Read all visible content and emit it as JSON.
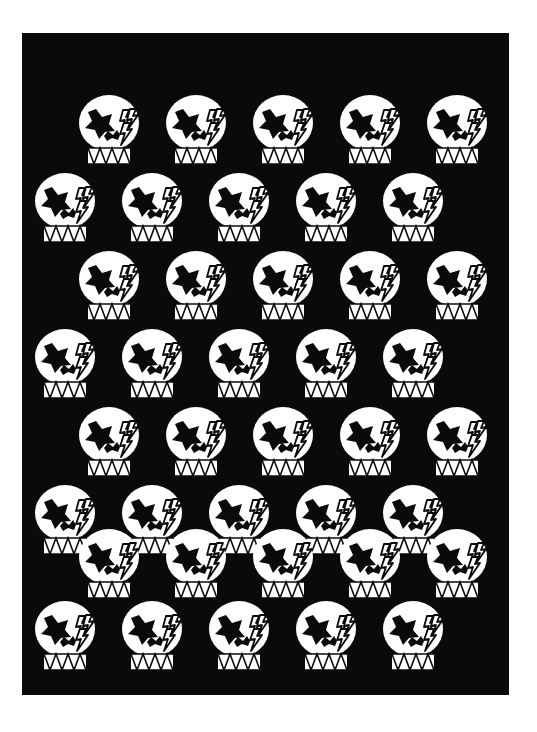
{
  "artwork": {
    "title": "Repeating skull motif pattern",
    "background_color": "#ffffff",
    "panel_color": "#0a0a0a",
    "motif_color": "#ffffff",
    "detail_color": "#0a0a0a",
    "panel": {
      "x": 22,
      "y": 33,
      "width": 487,
      "height": 662
    },
    "motif": {
      "name": "skull-with-star-eye-and-lightning-bolts",
      "width": 74,
      "height": 78,
      "parts": [
        "skull-dome",
        "star-eye-socket",
        "nose-hole",
        "lightning-bolt-1",
        "lightning-bolt-2",
        "lightning-bolt-3",
        "zigzag-teeth"
      ]
    },
    "grid": {
      "rows": 8,
      "columns": 5,
      "stagger": "odd rows indented right, even rows indented left",
      "row_y": [
        60,
        138,
        216,
        294,
        372,
        450,
        528,
        590
      ],
      "row_offset_x": [
        52,
        8,
        52,
        8,
        52,
        8,
        52,
        8
      ],
      "column_step": 87,
      "count_total": 40
    },
    "cells": [
      {
        "row": 1,
        "col": 1,
        "x": 52,
        "y": 60
      },
      {
        "row": 1,
        "col": 2,
        "x": 139,
        "y": 60
      },
      {
        "row": 1,
        "col": 3,
        "x": 226,
        "y": 60
      },
      {
        "row": 1,
        "col": 4,
        "x": 313,
        "y": 60
      },
      {
        "row": 1,
        "col": 5,
        "x": 400,
        "y": 60
      },
      {
        "row": 2,
        "col": 1,
        "x": 8,
        "y": 138
      },
      {
        "row": 2,
        "col": 2,
        "x": 95,
        "y": 138
      },
      {
        "row": 2,
        "col": 3,
        "x": 182,
        "y": 138
      },
      {
        "row": 2,
        "col": 4,
        "x": 269,
        "y": 138
      },
      {
        "row": 2,
        "col": 5,
        "x": 356,
        "y": 138
      },
      {
        "row": 3,
        "col": 1,
        "x": 52,
        "y": 216
      },
      {
        "row": 3,
        "col": 2,
        "x": 139,
        "y": 216
      },
      {
        "row": 3,
        "col": 3,
        "x": 226,
        "y": 216
      },
      {
        "row": 3,
        "col": 4,
        "x": 313,
        "y": 216
      },
      {
        "row": 3,
        "col": 5,
        "x": 400,
        "y": 216
      },
      {
        "row": 4,
        "col": 1,
        "x": 8,
        "y": 294
      },
      {
        "row": 4,
        "col": 2,
        "x": 95,
        "y": 294
      },
      {
        "row": 4,
        "col": 3,
        "x": 182,
        "y": 294
      },
      {
        "row": 4,
        "col": 4,
        "x": 269,
        "y": 294
      },
      {
        "row": 4,
        "col": 5,
        "x": 356,
        "y": 294
      },
      {
        "row": 5,
        "col": 1,
        "x": 52,
        "y": 372
      },
      {
        "row": 5,
        "col": 2,
        "x": 139,
        "y": 372
      },
      {
        "row": 5,
        "col": 3,
        "x": 226,
        "y": 372
      },
      {
        "row": 5,
        "col": 4,
        "x": 313,
        "y": 372
      },
      {
        "row": 5,
        "col": 5,
        "x": 400,
        "y": 372
      },
      {
        "row": 6,
        "col": 1,
        "x": 8,
        "y": 450
      },
      {
        "row": 6,
        "col": 2,
        "x": 95,
        "y": 450
      },
      {
        "row": 6,
        "col": 3,
        "x": 182,
        "y": 450
      },
      {
        "row": 6,
        "col": 4,
        "x": 269,
        "y": 450
      },
      {
        "row": 6,
        "col": 5,
        "x": 356,
        "y": 450
      },
      {
        "row": 7,
        "col": 1,
        "x": 52,
        "y": 494
      },
      {
        "row": 7,
        "col": 2,
        "x": 139,
        "y": 494
      },
      {
        "row": 7,
        "col": 3,
        "x": 226,
        "y": 494
      },
      {
        "row": 7,
        "col": 4,
        "x": 313,
        "y": 494
      },
      {
        "row": 7,
        "col": 5,
        "x": 400,
        "y": 494
      },
      {
        "row": 8,
        "col": 1,
        "x": 8,
        "y": 566
      },
      {
        "row": 8,
        "col": 2,
        "x": 95,
        "y": 566
      },
      {
        "row": 8,
        "col": 3,
        "x": 182,
        "y": 566
      },
      {
        "row": 8,
        "col": 4,
        "x": 269,
        "y": 566
      },
      {
        "row": 8,
        "col": 5,
        "x": 356,
        "y": 566
      }
    ]
  }
}
